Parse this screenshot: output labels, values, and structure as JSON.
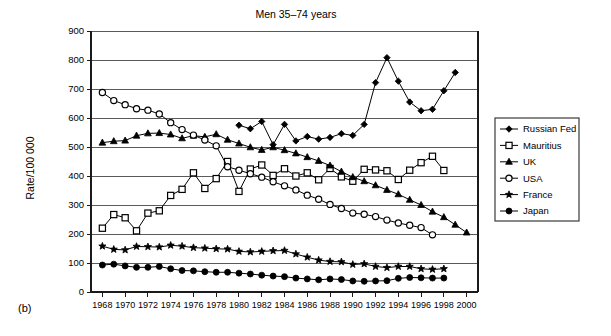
{
  "figure": {
    "panel_label": "(b)",
    "title": "Men 35–74 years",
    "ylabel": "Rate/100 000"
  },
  "legend": {
    "position": "right-outside",
    "entries": [
      {
        "label": "Russian Fed",
        "marker": "filled-diamond"
      },
      {
        "label": "Mauritius",
        "marker": "open-square"
      },
      {
        "label": "UK",
        "marker": "filled-triangle"
      },
      {
        "label": "USA",
        "marker": "open-circle"
      },
      {
        "label": "France",
        "marker": "filled-star"
      },
      {
        "label": "Japan",
        "marker": "filled-circle"
      }
    ]
  },
  "axes": {
    "y_ticks": [
      0,
      100,
      200,
      300,
      400,
      500,
      600,
      700,
      800,
      900
    ],
    "y_tick_labels": [
      "0",
      "100",
      "200",
      "300",
      "400",
      "500",
      "600",
      "700",
      "800",
      "900"
    ],
    "x_ticks": [
      1968,
      1970,
      1972,
      1974,
      1976,
      1978,
      1980,
      1982,
      1984,
      1986,
      1988,
      1990,
      1992,
      1994,
      1996,
      1998,
      2000
    ],
    "x_tick_labels": [
      "1968",
      "1970",
      "1972",
      "1974",
      "1976",
      "1978",
      "1980",
      "1982",
      "1984",
      "1986",
      "1988",
      "1990",
      "1992",
      "1994",
      "1996",
      "1998",
      "2000"
    ]
  },
  "chart_data": {
    "type": "line",
    "title": "Men 35–74 years",
    "xlabel": "",
    "ylabel": "Rate/100 000",
    "xlim": [
      1967,
      2001
    ],
    "ylim": [
      0,
      900
    ],
    "grid": "horizontal",
    "legend_position": "right-outside",
    "series": [
      {
        "name": "Russian Fed",
        "marker": "filled-diamond",
        "color": "#000000",
        "x": [
          1980,
          1981,
          1982,
          1983,
          1984,
          1985,
          1986,
          1987,
          1988,
          1989,
          1990,
          1991,
          1992,
          1993,
          1994,
          1995,
          1996,
          1997,
          1998,
          1999
        ],
        "y": [
          575,
          563,
          588,
          508,
          578,
          521,
          536,
          527,
          533,
          546,
          540,
          578,
          722,
          808,
          727,
          655,
          625,
          630,
          694,
          757
        ]
      },
      {
        "name": "Mauritius",
        "marker": "open-square",
        "color": "#000000",
        "x": [
          1968,
          1969,
          1970,
          1971,
          1972,
          1973,
          1974,
          1975,
          1976,
          1977,
          1978,
          1979,
          1980,
          1981,
          1982,
          1983,
          1984,
          1985,
          1986,
          1987,
          1988,
          1989,
          1990,
          1991,
          1992,
          1993,
          1994,
          1995,
          1996,
          1997,
          1998
        ],
        "y": [
          220,
          267,
          256,
          211,
          272,
          280,
          333,
          354,
          411,
          357,
          391,
          450,
          347,
          424,
          438,
          402,
          425,
          400,
          411,
          387,
          426,
          397,
          382,
          423,
          421,
          418,
          388,
          420,
          446,
          468,
          419
        ]
      },
      {
        "name": "UK",
        "marker": "filled-triangle",
        "color": "#000000",
        "x": [
          1968,
          1969,
          1970,
          1971,
          1972,
          1973,
          1974,
          1975,
          1976,
          1977,
          1978,
          1979,
          1980,
          1981,
          1982,
          1983,
          1984,
          1985,
          1986,
          1987,
          1988,
          1989,
          1990,
          1991,
          1992,
          1993,
          1994,
          1995,
          1996,
          1997,
          1998,
          1999,
          2000
        ],
        "y": [
          515,
          520,
          522,
          539,
          547,
          548,
          543,
          530,
          539,
          535,
          544,
          525,
          512,
          499,
          490,
          499,
          489,
          478,
          465,
          452,
          436,
          415,
          396,
          382,
          368,
          352,
          337,
          318,
          300,
          277,
          258,
          232,
          205
        ]
      },
      {
        "name": "USA",
        "marker": "open-circle",
        "color": "#000000",
        "x": [
          1968,
          1969,
          1970,
          1971,
          1972,
          1973,
          1974,
          1975,
          1976,
          1977,
          1978,
          1979,
          1980,
          1981,
          1982,
          1983,
          1984,
          1985,
          1986,
          1987,
          1988,
          1989,
          1990,
          1991,
          1992,
          1993,
          1994,
          1995,
          1996,
          1997
        ],
        "y": [
          688,
          660,
          646,
          632,
          627,
          614,
          584,
          560,
          541,
          524,
          504,
          432,
          420,
          408,
          396,
          380,
          366,
          352,
          334,
          320,
          302,
          288,
          272,
          268,
          260,
          248,
          238,
          230,
          222,
          197
        ]
      },
      {
        "name": "France",
        "marker": "filled-star",
        "color": "#000000",
        "x": [
          1968,
          1969,
          1970,
          1971,
          1972,
          1973,
          1974,
          1975,
          1976,
          1977,
          1978,
          1979,
          1980,
          1981,
          1982,
          1983,
          1984,
          1985,
          1986,
          1987,
          1988,
          1989,
          1990,
          1991,
          1992,
          1993,
          1994,
          1995,
          1996,
          1997,
          1998
        ],
        "y": [
          158,
          147,
          145,
          157,
          156,
          155,
          161,
          158,
          153,
          151,
          149,
          148,
          140,
          138,
          140,
          142,
          143,
          131,
          120,
          110,
          105,
          104,
          95,
          97,
          88,
          84,
          88,
          88,
          80,
          78,
          80
        ]
      },
      {
        "name": "Japan",
        "marker": "filled-circle",
        "color": "#000000",
        "x": [
          1968,
          1969,
          1970,
          1971,
          1972,
          1973,
          1974,
          1975,
          1976,
          1977,
          1978,
          1979,
          1980,
          1981,
          1982,
          1983,
          1984,
          1985,
          1986,
          1987,
          1988,
          1989,
          1990,
          1991,
          1992,
          1993,
          1994,
          1995,
          1996,
          1997,
          1998
        ],
        "y": [
          93,
          96,
          90,
          85,
          85,
          88,
          80,
          74,
          73,
          70,
          68,
          68,
          65,
          62,
          58,
          55,
          53,
          48,
          45,
          42,
          45,
          43,
          38,
          37,
          38,
          39,
          47,
          50,
          49,
          48,
          48
        ]
      }
    ]
  }
}
